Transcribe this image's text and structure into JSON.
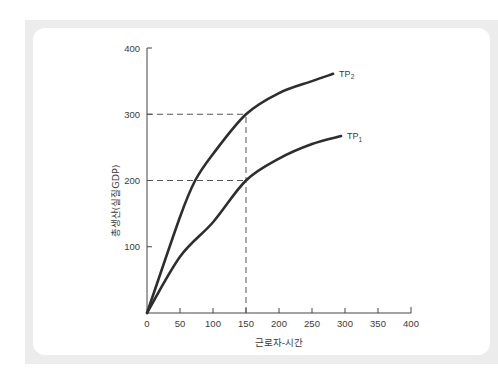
{
  "chart_data": {
    "type": "line",
    "title": "",
    "xlabel": "근로자-시간",
    "ylabel": "총생산(실질GDP)",
    "xlim": [
      0,
      400
    ],
    "ylim": [
      0,
      400
    ],
    "x_ticks": [
      0,
      50,
      100,
      150,
      200,
      250,
      300,
      350,
      400
    ],
    "y_ticks": [
      100,
      200,
      300,
      400
    ],
    "grid": false,
    "series": [
      {
        "name": "TP1",
        "label_main": "TP",
        "label_sub": "1",
        "x": [
          0,
          50,
          100,
          150,
          200,
          250,
          294
        ],
        "y": [
          0,
          85,
          137,
          200,
          233,
          255,
          267
        ]
      },
      {
        "name": "TP2",
        "label_main": "TP",
        "label_sub": "2",
        "x": [
          0,
          50,
          73,
          100,
          150,
          200,
          250,
          282
        ],
        "y": [
          0,
          145,
          200,
          240,
          300,
          332,
          350,
          361
        ]
      }
    ],
    "annotations": [
      {
        "type": "dashed-hline",
        "y": 300,
        "x_from": 0,
        "x_to": 150
      },
      {
        "type": "dashed-hline",
        "y": 200,
        "x_from": 0,
        "x_to": 150
      },
      {
        "type": "dashed-vline",
        "x": 150,
        "y_from": 0,
        "y_to": 300
      }
    ]
  },
  "colors": {
    "line": "#2e2e2e",
    "frame": "#ececec",
    "card": "#ffffff",
    "text": "#3a3a3a"
  }
}
